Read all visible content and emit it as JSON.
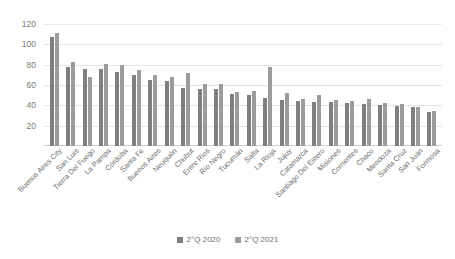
{
  "chart_data": {
    "type": "bar",
    "title": "",
    "xlabel": "",
    "ylabel": "",
    "ylim": [
      0,
      120
    ],
    "yticks": [
      20,
      40,
      60,
      80,
      100,
      120
    ],
    "grid": true,
    "legend_position": "bottom",
    "categories": [
      "Buenos Aires City",
      "San Luis",
      "Tierra Del Fuego",
      "La Pampa",
      "Córdoba",
      "Santa Fe",
      "Buenos Aires",
      "Neuquén",
      "Chubut",
      "Entre Rios",
      "Río Negro",
      "Tucumán",
      "Salta",
      "La Rioja",
      "Jujuy",
      "Catamarca",
      "Santiago Del Estero",
      "Misiones",
      "Corrientes",
      "Chaco",
      "Mendoza",
      "Santa Cruz",
      "San Juan",
      "Formosa"
    ],
    "series": [
      {
        "name": "2°Q 2020",
        "color": "#7f7f7f",
        "values": [
          107,
          78,
          76,
          76,
          73,
          70,
          65,
          64,
          57,
          56,
          56,
          51,
          50,
          47,
          45,
          44,
          43,
          43,
          42,
          41,
          40,
          39,
          38,
          33
        ]
      },
      {
        "name": "2°Q 2021",
        "color": "#9c9c9c",
        "values": [
          111,
          83,
          68,
          81,
          80,
          75,
          70,
          68,
          72,
          61,
          61,
          53,
          54,
          78,
          52,
          46,
          50,
          45,
          44,
          46,
          42,
          41,
          38,
          34
        ]
      }
    ]
  },
  "legend": {
    "items": [
      {
        "label": "2°Q 2020"
      },
      {
        "label": "2°Q 2021"
      }
    ]
  },
  "colors": {
    "series_2020": "#7f7f7f",
    "series_2021": "#9c9c9c",
    "gridline": "#e2e2e2",
    "text": "#6e6e6e",
    "background": "#ffffff"
  }
}
